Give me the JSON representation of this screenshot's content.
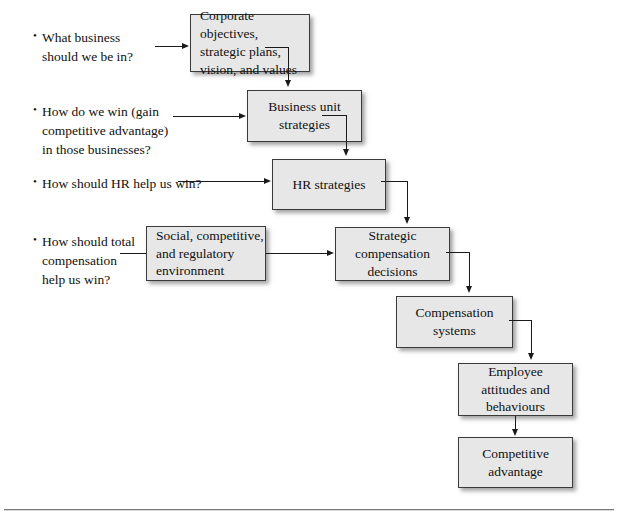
{
  "diagram": {
    "type": "flowchart",
    "accent_color": "#e7e7e7",
    "border_color": "#3a3a3a",
    "line_color": "#1a1a1a",
    "questions": [
      {
        "id": "q1",
        "bullet": "•",
        "lines": [
          "What business",
          "should we be in?"
        ]
      },
      {
        "id": "q2",
        "bullet": "•",
        "lines": [
          "How do we win (gain",
          "competitive advantage)",
          "in those businesses?"
        ]
      },
      {
        "id": "q3",
        "bullet": "•",
        "lines": [
          "How should HR help us win?"
        ]
      },
      {
        "id": "q4",
        "bullet": "•",
        "lines": [
          "How should total",
          "compensation",
          "help us win?"
        ]
      }
    ],
    "boxes": [
      {
        "id": "b1",
        "lines": [
          "Corporate objectives,",
          "strategic plans,",
          "vision, and values"
        ]
      },
      {
        "id": "b2",
        "lines": [
          "Business unit",
          "strategies"
        ]
      },
      {
        "id": "b3",
        "lines": [
          "HR strategies"
        ]
      },
      {
        "id": "b4",
        "lines": [
          "Social, competitive,",
          "and regulatory",
          "environment"
        ]
      },
      {
        "id": "b5",
        "lines": [
          "Strategic",
          "compensation",
          "decisions"
        ]
      },
      {
        "id": "b6",
        "lines": [
          "Compensation",
          "systems"
        ]
      },
      {
        "id": "b7",
        "lines": [
          "Employee",
          "attitudes and",
          "behaviours"
        ]
      },
      {
        "id": "b8",
        "lines": [
          "Competitive",
          "advantage"
        ]
      }
    ]
  }
}
